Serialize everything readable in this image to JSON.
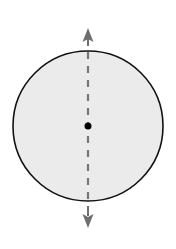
{
  "diagram": {
    "circle": {
      "cx": 88,
      "cy": 126,
      "r": 75,
      "fill": "#ebebeb",
      "stroke": "#111111"
    },
    "axis": {
      "x": 88,
      "y1": 52,
      "y2": 200,
      "color": "#777777",
      "dash": "7 7"
    },
    "center_dot": {
      "cx": 88,
      "cy": 126,
      "r": 3.5,
      "color": "#000000"
    },
    "arrows": [
      {
        "direction": "up",
        "tip_y": 28,
        "base_y": 42,
        "color": "#6f6f6f"
      },
      {
        "direction": "down",
        "tip_y": 228,
        "base_y": 214,
        "color": "#6f6f6f"
      }
    ]
  }
}
